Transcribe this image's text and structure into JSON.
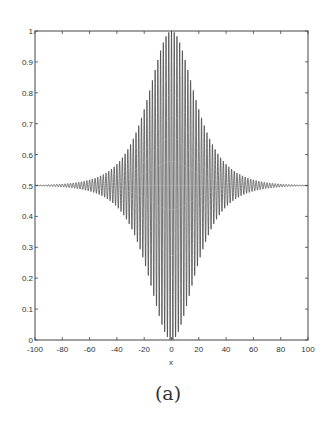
{
  "chart_data": {
    "type": "line",
    "title": "",
    "xlabel": "x",
    "ylabel": "",
    "xlim": [
      -100,
      100
    ],
    "ylim": [
      0,
      1
    ],
    "xticks": [
      -100,
      -80,
      -60,
      -40,
      -20,
      0,
      20,
      40,
      60,
      80,
      100
    ],
    "yticks": [
      0,
      0.1,
      0.2,
      0.3,
      0.4,
      0.5,
      0.6,
      0.7,
      0.8,
      0.9,
      1
    ],
    "xtick_labels": [
      "-100",
      "-80",
      "-60",
      "-40",
      "-20",
      "0",
      "20",
      "40",
      "60",
      "80",
      "100"
    ],
    "ytick_labels": [
      "0",
      "0.1",
      "0.2",
      "0.3",
      "0.4",
      "0.5",
      "0.6",
      "0.7",
      "0.8",
      "0.9",
      "1"
    ],
    "grid": false,
    "legend": null,
    "series": [
      {
        "name": "oscillating signal",
        "description": "0.5 + 0.5*sech(x/15)*cos(pi*x); rapid oscillation (period ~2) about 0.5 with envelope peaking at 1 and 0 at x=0, decaying to ~0.5 by |x|>=90",
        "baseline": 0.5,
        "peak_max": 1.0,
        "peak_min": 0.0,
        "period": 2,
        "envelope_samples": {
          "x": [
            0,
            10,
            17,
            20,
            30,
            40,
            60,
            80,
            100
          ],
          "upper": [
            1.0,
            0.9,
            0.8,
            0.76,
            0.64,
            0.57,
            0.51,
            0.505,
            0.5
          ],
          "lower": [
            0.0,
            0.1,
            0.2,
            0.24,
            0.36,
            0.43,
            0.49,
            0.495,
            0.5
          ]
        },
        "color": "#3a3a3a"
      }
    ]
  },
  "caption": "(a)"
}
